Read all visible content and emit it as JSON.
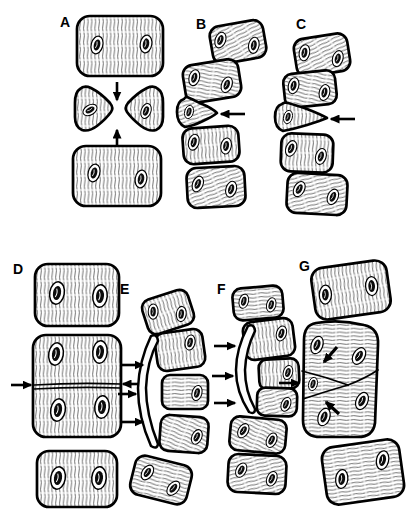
{
  "diagram": {
    "background_color": "#ffffff",
    "ink_color": "#000000",
    "panels": [
      {
        "label": "A"
      },
      {
        "label": "B"
      },
      {
        "label": "C"
      },
      {
        "label": "D"
      },
      {
        "label": "E"
      },
      {
        "label": "F"
      },
      {
        "label": "G"
      }
    ]
  }
}
